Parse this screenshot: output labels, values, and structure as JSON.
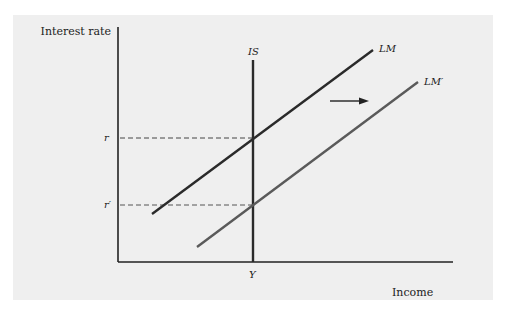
{
  "diagram": {
    "y_axis_label": "Interest rate",
    "x_axis_label": "Income",
    "curves": {
      "is": {
        "label": "IS",
        "color": "#2a2a2a"
      },
      "lm": {
        "label": "LM",
        "color": "#2a2a2a"
      },
      "lm_prime": {
        "label": "LM′",
        "color": "#5a5a5a"
      }
    },
    "levels": {
      "r": "r",
      "r_prime": "r′",
      "y": "Y"
    },
    "shift_arrow": {
      "direction": "right"
    },
    "colors": {
      "panel": "#efefef",
      "axis": "#222222",
      "dash": "#444444"
    }
  }
}
